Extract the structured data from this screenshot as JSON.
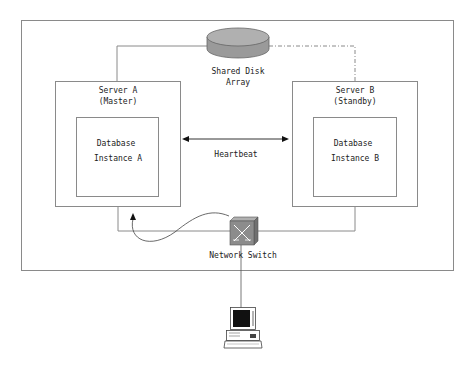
{
  "diagram": {
    "shared_disk": {
      "label_line1": "Shared Disk",
      "label_line2": "Array"
    },
    "server_a": {
      "title_line1": "Server A",
      "title_line2": "(Master)",
      "instance_line1": "Database",
      "instance_line2": "Instance A"
    },
    "server_b": {
      "title_line1": "Server B",
      "title_line2": "(Standby)",
      "instance_line1": "Database",
      "instance_line2": "Instance B"
    },
    "heartbeat": {
      "label": "Heartbeat"
    },
    "network_switch": {
      "label": "Network Switch"
    },
    "client": {
      "label": ""
    },
    "colors": {
      "line": "#8a8a8a",
      "disk_fill": "#9a9a9a",
      "switch_fill": "#8c8c8c",
      "text": "#222222"
    }
  }
}
